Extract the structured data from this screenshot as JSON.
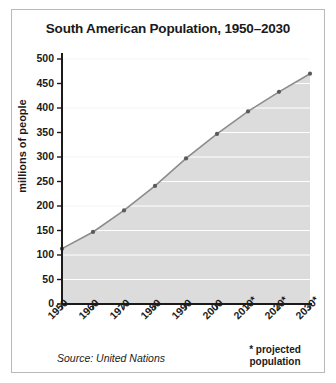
{
  "chart_data": {
    "type": "area",
    "title": "South American Population, 1950–2030",
    "xlabel": "",
    "ylabel": "millions of people",
    "categories": [
      "1950",
      "1960",
      "1970",
      "1980",
      "1990",
      "2000",
      "2010*",
      "2020*",
      "2030*"
    ],
    "values": [
      113,
      147,
      191,
      241,
      297,
      347,
      393,
      433,
      470
    ],
    "ylim": [
      0,
      500
    ],
    "ytick_labels": [
      "0",
      "50",
      "100",
      "150",
      "200",
      "250",
      "300",
      "350",
      "400",
      "450",
      "500"
    ],
    "ytick_values": [
      0,
      50,
      100,
      150,
      200,
      250,
      300,
      350,
      400,
      450,
      500
    ],
    "grid": true,
    "legend": "none",
    "area_fill_color": "#dcdcdc",
    "line_color": "#8c8c8c",
    "marker_color": "#5a5a5a",
    "gridline_color": "#ffffff",
    "axis_color": "#1a1a1a"
  },
  "footer": {
    "source": "Source: United Nations",
    "projected_note": "* projected population"
  }
}
